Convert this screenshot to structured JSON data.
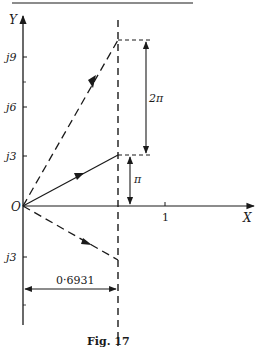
{
  "figure": {
    "caption": "Fig. 17",
    "colors": {
      "ink": "#1a1a1a",
      "background": "#ffffff"
    },
    "axes": {
      "x_label": "X",
      "y_label": "Y",
      "origin_label": "O",
      "x_ticks": [
        {
          "label": "1",
          "value": 1
        }
      ],
      "y_ticks": [
        {
          "label": "j9",
          "value": 9
        },
        {
          "label": "j6",
          "value": 6
        },
        {
          "label": "j3",
          "value": 3
        },
        {
          "label": "j3",
          "value": -3
        }
      ]
    },
    "vectors": [
      {
        "name": "upper-dashed-vector",
        "style": "dashed",
        "from": [
          0,
          0
        ],
        "to": [
          0.6931,
          9.42
        ]
      },
      {
        "name": "solid-vector",
        "style": "solid",
        "from": [
          0,
          0
        ],
        "to": [
          0.6931,
          3.14
        ]
      },
      {
        "name": "lower-dashed-vector",
        "style": "dashed",
        "from": [
          0,
          0
        ],
        "to": [
          0.6931,
          -3.14
        ]
      }
    ],
    "dimensions": {
      "two_pi_label": "2π",
      "pi_label": "π",
      "x_distance_label": "0·6931"
    },
    "vertical_line": {
      "style": "dashed",
      "x": 0.6931
    }
  }
}
